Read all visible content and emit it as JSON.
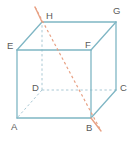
{
  "figure": {
    "name": "labeled-cube-with-diagonal-line",
    "width": 133,
    "height": 143,
    "background_color": "#ffffff"
  },
  "colors": {
    "edge_solid": "#7fb6c4",
    "edge_hidden_dashed": "#a9c8d4",
    "diagonal_line": "#e8a184",
    "label_text": "#5f5f5f"
  },
  "vertices": [
    {
      "label": "A",
      "x": 17,
      "y": 118,
      "label_x": 11,
      "label_y": 130,
      "hidden": false
    },
    {
      "label": "B",
      "x": 91,
      "y": 118,
      "label_x": 86,
      "label_y": 131,
      "hidden": false
    },
    {
      "label": "C",
      "x": 116,
      "y": 90,
      "label_x": 120,
      "label_y": 91,
      "hidden": false
    },
    {
      "label": "D",
      "x": 42,
      "y": 90,
      "label_x": 32,
      "label_y": 91,
      "hidden": true
    },
    {
      "label": "E",
      "x": 17,
      "y": 50,
      "label_x": 7,
      "label_y": 49,
      "hidden": false
    },
    {
      "label": "F",
      "x": 91,
      "y": 50,
      "label_x": 85,
      "label_y": 48,
      "hidden": false
    },
    {
      "label": "G",
      "x": 116,
      "y": 22,
      "label_x": 113,
      "label_y": 14,
      "hidden": false
    },
    {
      "label": "H",
      "x": 42,
      "y": 22,
      "label_x": 46,
      "label_y": 19,
      "hidden": false
    }
  ],
  "edges_solid": [
    {
      "name": "edge-A-B",
      "from": "A",
      "to": "B"
    },
    {
      "name": "edge-B-C",
      "from": "B",
      "to": "C"
    },
    {
      "name": "edge-A-E",
      "from": "A",
      "to": "E"
    },
    {
      "name": "edge-C-G",
      "from": "C",
      "to": "G"
    },
    {
      "name": "edge-E-F",
      "from": "E",
      "to": "F"
    },
    {
      "name": "edge-F-G",
      "from": "F",
      "to": "G"
    },
    {
      "name": "edge-E-H",
      "from": "E",
      "to": "H"
    },
    {
      "name": "edge-H-G",
      "from": "H",
      "to": "G"
    },
    {
      "name": "edge-B-F",
      "from": "B",
      "to": "F"
    }
  ],
  "edges_hidden": [
    {
      "name": "edge-D-A",
      "from": "D",
      "to": "A"
    },
    {
      "name": "edge-D-C",
      "from": "D",
      "to": "C"
    },
    {
      "name": "edge-D-H",
      "from": "D",
      "to": "H"
    }
  ],
  "diagonal": {
    "name": "diagonal-line-H-B",
    "through": [
      "H",
      "B"
    ],
    "start_x": 35,
    "start_y": 7,
    "end_x": 101,
    "end_y": 131,
    "style": "dashed-with-solid-ends",
    "solid_cap_start": {
      "x1": 35,
      "y1": 7,
      "x2": 42,
      "y2": 22
    },
    "solid_cap_end": {
      "x1": 91,
      "y1": 118,
      "x2": 101,
      "y2": 131
    }
  },
  "chart_data": {
    "type": "diagram",
    "title": "",
    "shape": "cube",
    "vertex_labels": [
      "A",
      "B",
      "C",
      "D",
      "E",
      "F",
      "G",
      "H"
    ],
    "annotations": [
      "line through H and B extended beyond the cube"
    ]
  }
}
